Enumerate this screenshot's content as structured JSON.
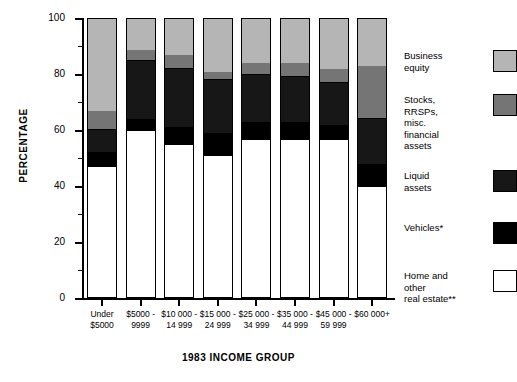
{
  "chart_data": {
    "type": "bar",
    "subtype": "stacked-bar-100-percent",
    "title": "",
    "xlabel": "1983 INCOME GROUP",
    "ylabel": "PERCENTAGE",
    "ylim": [
      0,
      100
    ],
    "yticks": [
      0,
      20,
      40,
      60,
      80,
      100
    ],
    "yminorticks": [
      10,
      30,
      50,
      70,
      90
    ],
    "ytick_labels": [
      "0",
      "20",
      "40",
      "60",
      "80",
      "100"
    ],
    "grid": false,
    "legend_position": "right",
    "categories": [
      "Under $5000",
      "$5000 - 9999",
      "$10 000 - 14 999",
      "$15 000 - 24 999",
      "$25 000 - 34 999",
      "$35 000 - 44 999",
      "$45 000 - 59 999",
      "$60 000+"
    ],
    "category_lines": [
      [
        "Under",
        "$5000"
      ],
      [
        "$5000 -",
        "9999"
      ],
      [
        "$10 000 -",
        "14 999"
      ],
      [
        "$15 000 -",
        "24 999"
      ],
      [
        "$25 000 -",
        "34 999"
      ],
      [
        "$35 000 -",
        "44 999"
      ],
      [
        "$45 000 -",
        "59 999"
      ],
      [
        "$60 000+",
        ""
      ]
    ],
    "series": [
      {
        "name": "Home and other real estate**",
        "key": "home",
        "color": "#ffffff",
        "values": [
          47,
          60,
          55,
          51,
          57,
          57,
          57,
          40
        ]
      },
      {
        "name": "Vehicles*",
        "key": "vehicles",
        "color": "#000000",
        "values": [
          5,
          4,
          6,
          8,
          6,
          6,
          5,
          8
        ]
      },
      {
        "name": "Liquid assets",
        "key": "liquid",
        "color": "#171717",
        "values": [
          8,
          21,
          21,
          19,
          17,
          16,
          15,
          16
        ]
      },
      {
        "name": "Stocks, RRSPs, misc. financial assets",
        "key": "stocks",
        "color": "#757575",
        "values": [
          7,
          4,
          5,
          3,
          4,
          5,
          5,
          19
        ]
      },
      {
        "name": "Business equity",
        "key": "business",
        "color": "#b5b5b5",
        "values": [
          33,
          11,
          13,
          19,
          16,
          16,
          18,
          17
        ]
      }
    ]
  },
  "legend": {
    "items": [
      {
        "label": "Business\nequity",
        "swatch": "sw-business",
        "name": "business-equity"
      },
      {
        "label": "Stocks,\nRRSPs,\nmisc.\nfinancial\nassets",
        "swatch": "sw-stocks",
        "name": "stocks-rrsps"
      },
      {
        "label": "Liquid\nassets",
        "swatch": "sw-liquid",
        "name": "liquid-assets"
      },
      {
        "label": "Vehicles*",
        "swatch": "sw-vehicles",
        "name": "vehicles"
      },
      {
        "label": "Home and\nother\nreal estate**",
        "swatch": "sw-home",
        "name": "home-real-estate"
      }
    ]
  },
  "colors": {
    "business_equity": "#b5b5b5",
    "stocks_rrsps": "#757575",
    "liquid_assets": "#171717",
    "vehicles": "#000000",
    "home_real_estate": "#ffffff",
    "axis": "#000000",
    "background": "#ffffff"
  }
}
